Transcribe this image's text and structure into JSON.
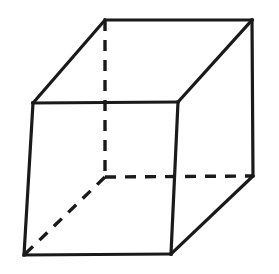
{
  "figure": {
    "shape_name": "cube",
    "projection": "oblique parallel projection",
    "canvas": {
      "width": 279,
      "height": 274
    },
    "colors": {
      "background": "#ffffff",
      "stroke": "#1a1a1a",
      "face_fill": "#ffffff"
    },
    "stroke_width_solid": 3.2,
    "stroke_width_hidden": 3.4,
    "dash_pattern": "11 9"
  },
  "chart_data": {
    "type": "diagram",
    "vertices": {
      "front_top_left": {
        "x": 33,
        "y": 103,
        "hidden": false
      },
      "front_top_right": {
        "x": 178,
        "y": 102,
        "hidden": false
      },
      "front_bottom_right": {
        "x": 171,
        "y": 254,
        "hidden": false
      },
      "front_bottom_left": {
        "x": 24,
        "y": 255,
        "hidden": false
      },
      "back_top_left": {
        "x": 105,
        "y": 20,
        "hidden": false
      },
      "back_top_right": {
        "x": 252,
        "y": 20,
        "hidden": false
      },
      "back_bottom_right": {
        "x": 253,
        "y": 176,
        "hidden": false
      },
      "back_bottom_left": {
        "x": 105,
        "y": 177,
        "hidden": true
      }
    },
    "edges_visible": [
      {
        "name": "front-face-top",
        "from": "front_top_left",
        "to": "front_top_right"
      },
      {
        "name": "front-face-right",
        "from": "front_top_right",
        "to": "front_bottom_right"
      },
      {
        "name": "front-face-bottom",
        "from": "front_bottom_right",
        "to": "front_bottom_left"
      },
      {
        "name": "front-face-left",
        "from": "front_bottom_left",
        "to": "front_top_left"
      },
      {
        "name": "top-face-back",
        "from": "back_top_left",
        "to": "back_top_right"
      },
      {
        "name": "top-face-left-slant",
        "from": "front_top_left",
        "to": "back_top_left"
      },
      {
        "name": "top-face-right-slant",
        "from": "front_top_right",
        "to": "back_top_right"
      },
      {
        "name": "right-face-back",
        "from": "back_top_right",
        "to": "back_bottom_right"
      },
      {
        "name": "right-face-slant",
        "from": "back_bottom_right",
        "to": "front_bottom_right"
      }
    ],
    "edges_hidden": [
      {
        "name": "hidden-vertical",
        "from": "back_top_left",
        "to": "back_bottom_left"
      },
      {
        "name": "hidden-horizontal",
        "from": "back_bottom_left",
        "to": "back_bottom_right"
      },
      {
        "name": "hidden-diagonal",
        "from": "back_bottom_left",
        "to": "front_bottom_left"
      }
    ],
    "faces": [
      {
        "name": "front-face",
        "vertices": [
          "front_top_left",
          "front_top_right",
          "front_bottom_right",
          "front_bottom_left"
        ]
      },
      {
        "name": "top-face",
        "vertices": [
          "front_top_left",
          "back_top_left",
          "back_top_right",
          "front_top_right"
        ]
      },
      {
        "name": "right-face",
        "vertices": [
          "front_top_right",
          "back_top_right",
          "back_bottom_right",
          "front_bottom_right"
        ]
      }
    ],
    "counts": {
      "vertices": 8,
      "edges": 12,
      "visible_edges": 9,
      "hidden_edges": 3,
      "faces": 6
    }
  }
}
